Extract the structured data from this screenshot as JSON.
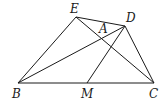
{
  "diagram": {
    "points": {
      "E": {
        "label": "E",
        "x": 76,
        "y": 17
      },
      "D": {
        "label": "D",
        "x": 125,
        "y": 26
      },
      "B": {
        "label": "B",
        "x": 18,
        "y": 83
      },
      "M": {
        "label": "M",
        "x": 87,
        "y": 83
      },
      "C": {
        "label": "C",
        "x": 154,
        "y": 83
      },
      "A": {
        "label": "A"
      }
    },
    "segments": [
      "BC",
      "BE",
      "ED",
      "DC",
      "BD",
      "EC",
      "MD"
    ]
  }
}
